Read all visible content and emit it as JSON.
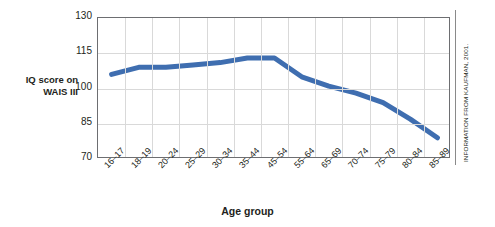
{
  "chart_data": {
    "type": "line",
    "title": "",
    "xlabel": "Age group",
    "ylabel": "IQ score on WAIS III",
    "ylabel_lines": [
      "IQ score on",
      "WAIS III"
    ],
    "categories": [
      "16–17",
      "18–19",
      "20–24",
      "25–29",
      "30–34",
      "35–44",
      "45–54",
      "55–64",
      "65–69",
      "70–74",
      "75–79",
      "80–84",
      "85–89"
    ],
    "values": [
      106,
      109,
      109,
      110,
      111,
      113,
      113,
      105,
      101,
      98,
      94,
      87,
      79
    ],
    "ylim": [
      70,
      130
    ],
    "yticks": [
      70,
      85,
      100,
      115,
      130
    ],
    "grid": true,
    "legend": "none",
    "series_color": "#3f6eb0",
    "annotation": "INFORMATION FROM KAUFMAN, 2001."
  },
  "credit": {
    "text": "INFORMATION FROM KAUFMAN, 2001."
  },
  "axes": {
    "x_title": "Age group",
    "y_title_line1": "IQ score on",
    "y_title_line2": "WAIS III"
  },
  "colors": {
    "line": "#3f6eb0",
    "grid": "#d9d9d9",
    "frame": "#6d6e71",
    "text": "#231f20",
    "background": "#ffffff"
  }
}
